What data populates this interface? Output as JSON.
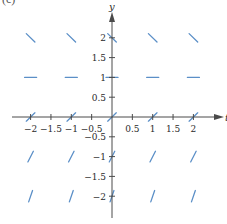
{
  "figure": {
    "corner_label": "(c)",
    "type": "slope field",
    "axes": {
      "x_label": "t",
      "y_label": "y",
      "x_ticks": [
        {
          "value": -2,
          "label": "−2"
        },
        {
          "value": -1.5,
          "label": "−1.5"
        },
        {
          "value": -1,
          "label": "−1"
        },
        {
          "value": -0.5,
          "label": "−0.5"
        },
        {
          "value": 0.5,
          "label": "0.5"
        },
        {
          "value": 1,
          "label": "1"
        },
        {
          "value": 1.5,
          "label": "1.5"
        },
        {
          "value": 2,
          "label": "2"
        }
      ],
      "y_ticks": [
        {
          "value": 2,
          "label": "2"
        },
        {
          "value": 1.5,
          "label": "1.5"
        },
        {
          "value": 1,
          "label": "1"
        },
        {
          "value": 0.5,
          "label": "0.5"
        },
        {
          "value": -0.5,
          "label": "−0.5"
        },
        {
          "value": -1,
          "label": "−1"
        },
        {
          "value": -1.5,
          "label": "−1.5"
        },
        {
          "value": -2,
          "label": "−2"
        }
      ],
      "x_range": [
        -2.2,
        2.6
      ],
      "y_range": [
        -2.5,
        2.4
      ]
    },
    "grid_t": [
      -2,
      -1,
      0,
      1,
      2
    ],
    "grid_y": [
      2,
      1,
      0,
      -1,
      -2
    ],
    "slopes_by_y": {
      "2": -1,
      "1": 0,
      "0": 1,
      "-1": 2,
      "-2": 3
    },
    "colors": {
      "axis": "#4a4a4a",
      "segment": "#5b8fc7",
      "text": "#2a2a2a"
    }
  }
}
